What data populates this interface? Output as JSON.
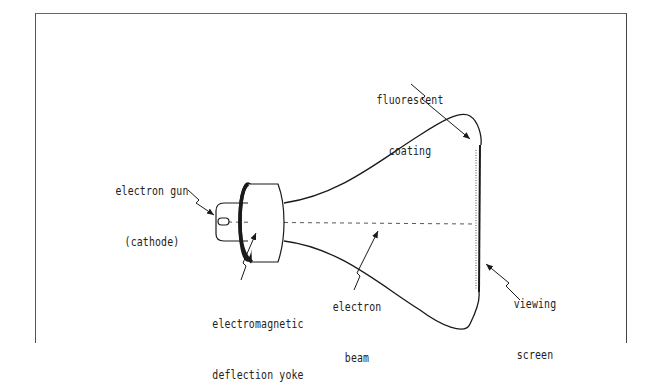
{
  "diagram": {
    "labels": {
      "fluorescent_coating": {
        "line1": "fluorescent",
        "line2": "coating"
      },
      "electron_gun": {
        "line1": "electron gun",
        "line2": "(cathode)"
      },
      "deflection_yoke": {
        "line1": "electromagnetic",
        "line2": "deflection yoke"
      },
      "electron_beam": {
        "line1": "electron",
        "line2": "beam"
      },
      "viewing_screen": {
        "line1": "viewing",
        "line2": "screen"
      }
    },
    "colors": {
      "line": "#1a1a1a",
      "frame": "#555555",
      "background": "#ffffff"
    }
  }
}
